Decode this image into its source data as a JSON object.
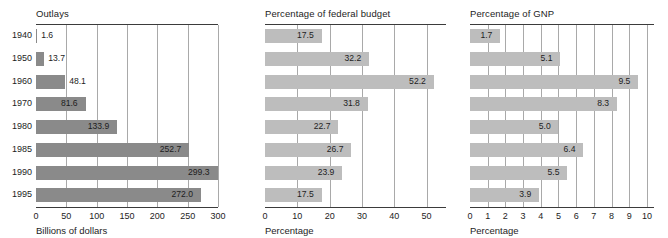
{
  "chart_data": {
    "type": "bar",
    "orientation": "horizontal",
    "title": "",
    "categories": [
      "1940",
      "1950",
      "1960",
      "1970",
      "1980",
      "1985",
      "1990",
      "1995"
    ],
    "ylabel": "",
    "grid": true,
    "legend": "none",
    "panels": [
      {
        "title": "Outlays",
        "xlabel": "Billions of dollars",
        "values": [
          1.6,
          13.7,
          48.1,
          81.6,
          133.9,
          252.7,
          299.3,
          272.0
        ],
        "value_labels": [
          "1.6",
          "13.7",
          "48.1",
          "81.6",
          "133.9",
          "252.7",
          "299.3",
          "272.0"
        ],
        "xticks": [
          0,
          50,
          100,
          150,
          200,
          250,
          300
        ],
        "xtick_labels": [
          "0",
          "50",
          "100",
          "150",
          "200",
          "250",
          "300"
        ],
        "xlim": [
          0,
          300
        ],
        "bar_color": "#8a8a8a"
      },
      {
        "title": "Percentage of federal budget",
        "xlabel": "Percentage",
        "values": [
          17.5,
          32.2,
          52.2,
          31.8,
          22.7,
          26.7,
          23.9,
          17.5
        ],
        "value_labels": [
          "17.5",
          "32.2",
          "52.2",
          "31.8",
          "22.7",
          "26.7",
          "23.9",
          "17.5"
        ],
        "xticks": [
          0,
          10,
          20,
          30,
          40,
          50
        ],
        "xtick_labels": [
          "0",
          "10",
          "20",
          "30",
          "40",
          "50"
        ],
        "xlim": [
          0,
          56
        ],
        "bar_color": "#bdbdbd"
      },
      {
        "title": "Percentage of GNP",
        "xlabel": "Percentage",
        "values": [
          1.7,
          5.1,
          9.5,
          8.3,
          5.0,
          6.4,
          5.5,
          3.9
        ],
        "value_labels": [
          "1.7",
          "5.1",
          "9.5",
          "8.3",
          "5.0",
          "6.4",
          "5.5",
          "3.9"
        ],
        "xticks": [
          0,
          1,
          2,
          3,
          4,
          5,
          6,
          7,
          8,
          9,
          10
        ],
        "xtick_labels": [
          "0",
          "1",
          "2",
          "3",
          "4",
          "5",
          "6",
          "7",
          "8",
          "9",
          "10"
        ],
        "xlim": [
          0,
          10.4
        ],
        "bar_color": "#bdbdbd"
      }
    ]
  }
}
